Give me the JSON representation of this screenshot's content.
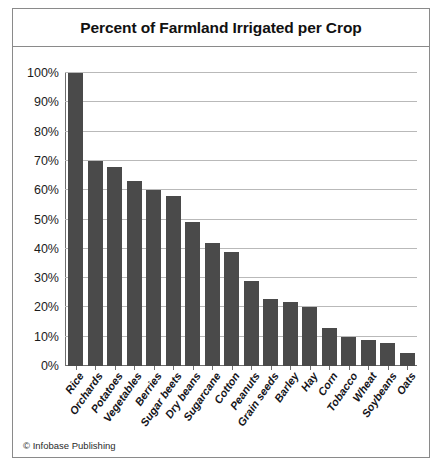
{
  "figure": {
    "title": "Percent of Farmland Irrigated per Crop",
    "credit": "© Infobase Publishing",
    "bar_color": "#4a4a4a",
    "grid_color": "#b9b9b9",
    "axis_color": "#6e6e6e",
    "border_color": "#8a8a8a",
    "background": "#ffffff"
  },
  "chart_data": {
    "type": "bar",
    "title": "Percent of Farmland Irrigated per Crop",
    "xlabel": "",
    "ylabel": "",
    "ylim": [
      0,
      100
    ],
    "yticks": [
      0,
      10,
      20,
      30,
      40,
      50,
      60,
      70,
      80,
      90,
      100
    ],
    "ytick_labels": [
      "0%",
      "10%",
      "20%",
      "30%",
      "40%",
      "50%",
      "60%",
      "70%",
      "80%",
      "90%",
      "100%"
    ],
    "grid": true,
    "legend": false,
    "orientation": "vertical",
    "categories": [
      "Rice",
      "Orchards",
      "Potatoes",
      "Vegetables",
      "Berries",
      "Sugar beets",
      "Dry beans",
      "Sugarcane",
      "Cotton",
      "Peanuts",
      "Grain seeds",
      "Barley",
      "Hay",
      "Corn",
      "Tobacco",
      "Wheat",
      "Soybeans",
      "Oats"
    ],
    "values": [
      100,
      70,
      68,
      63,
      60,
      58,
      49,
      42,
      39,
      29,
      23,
      22,
      20,
      13,
      10,
      9,
      8,
      4.5
    ],
    "units": "percent"
  }
}
